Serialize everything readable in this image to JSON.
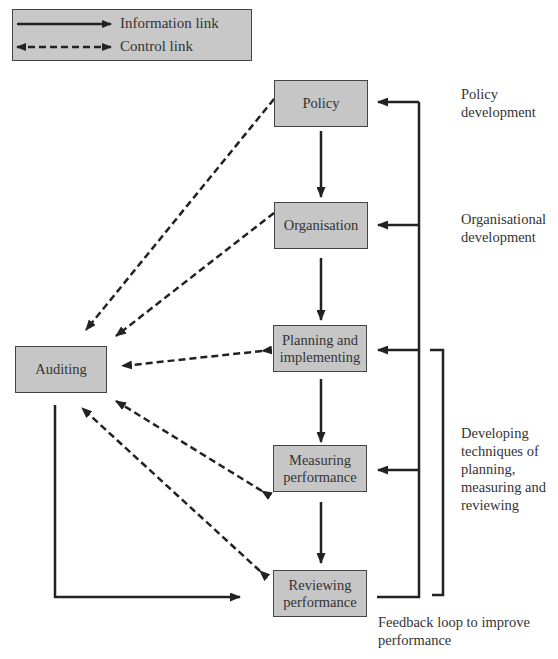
{
  "legend": {
    "information_link": "Information link",
    "control_link": "Control link"
  },
  "nodes": {
    "policy": "Policy",
    "organisation": "Organisation",
    "planning_line1": "Planning and",
    "planning_line2": "implementing",
    "measuring_line1": "Measuring",
    "measuring_line2": "performance",
    "reviewing_line1": "Reviewing",
    "reviewing_line2": "performance",
    "auditing": "Auditing"
  },
  "notes": {
    "policy_dev_line1": "Policy",
    "policy_dev_line2": "development",
    "org_dev_line1": "Organisational",
    "org_dev_line2": "development",
    "techniques_line1": "Developing",
    "techniques_line2": "techniques of",
    "techniques_line3": "planning,",
    "techniques_line4": "measuring and",
    "techniques_line5": "reviewing",
    "feedback_line1": "Feedback loop to improve",
    "feedback_line2": "performance"
  },
  "colors": {
    "box_fill": "#c6c6c6",
    "line": "#222222",
    "text": "#333333"
  }
}
